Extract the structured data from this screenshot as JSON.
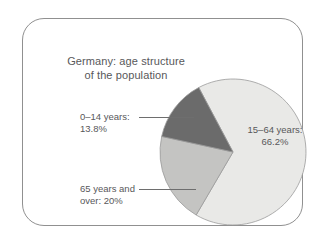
{
  "figure": {
    "title_line1": "Germany: age structure",
    "title_line2": "of the population",
    "frame_border_color": "#909090",
    "background_color": "#ffffff",
    "text_color": "#58585a"
  },
  "labels": {
    "young": {
      "line1": "0–14 years:",
      "line2": "13.8%"
    },
    "working": {
      "line1": "15–64 years:",
      "line2": "66.2%"
    },
    "old": {
      "line1": "65 years and",
      "line2": "over: 20%"
    }
  },
  "chart_data": {
    "type": "pie",
    "title": "Germany: age structure of the population",
    "subtitle": "",
    "xlabel": "",
    "ylabel": "",
    "grid": false,
    "legend_position": "none",
    "labels_inside": true,
    "units": "percent",
    "total": 100,
    "start_angle_deg": -28,
    "direction": "clockwise",
    "categories": [
      "15–64 years",
      "65 years and over",
      "0–14 years"
    ],
    "values": [
      66.2,
      20.0,
      13.8
    ],
    "colors": [
      "#e9e9e7",
      "#c4c4c2",
      "#6b6b6b"
    ],
    "slice_border_color": "#9a9a9a",
    "annotations": [
      "15–64 years: 66.2%",
      "65 years and over: 20%",
      "0–14 years: 13.8%"
    ],
    "series": [
      {
        "name": "Share of population",
        "values": [
          66.2,
          20.0,
          13.8
        ]
      }
    ]
  }
}
